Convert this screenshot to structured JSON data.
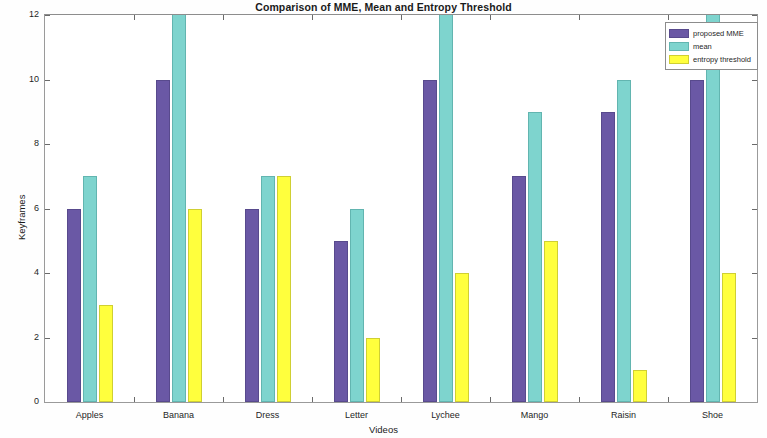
{
  "chart_data": {
    "type": "bar",
    "title": "Comparison of MME, Mean and Entropy Threshold",
    "xlabel": "Videos",
    "ylabel": "Keyframes",
    "ylim": [
      0,
      12
    ],
    "yticks": [
      0,
      2,
      4,
      6,
      8,
      10,
      12
    ],
    "ytick_labels": [
      "0",
      "2",
      "4",
      "6",
      "8",
      "10",
      "12"
    ],
    "grid": false,
    "legend_position": "top-right",
    "categories": [
      "Apples",
      "Banana",
      "Dress",
      "Letter",
      "Lychee",
      "Mango",
      "Raisin",
      "Shoe"
    ],
    "series": [
      {
        "name": "proposed MME",
        "color": "#6a58a5",
        "values": [
          6,
          10,
          6,
          5,
          10,
          7,
          9,
          10
        ]
      },
      {
        "name": "mean",
        "color": "#7ed4ce",
        "values": [
          7,
          13,
          7,
          6,
          13,
          9,
          10,
          13
        ],
        "clipped_at_top": [
          false,
          true,
          false,
          false,
          true,
          false,
          false,
          true
        ]
      },
      {
        "name": "entropy threshold",
        "color": "#ffff3d",
        "values": [
          3,
          6,
          7,
          2,
          4,
          5,
          1,
          4
        ]
      }
    ]
  },
  "legend": {
    "entries": [
      {
        "label": "proposed MME"
      },
      {
        "label": "mean"
      },
      {
        "label": "entropy threshold"
      }
    ]
  }
}
